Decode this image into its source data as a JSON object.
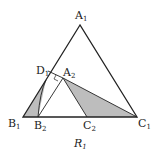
{
  "diagram": {
    "caption": "R",
    "caption_sub": "1",
    "colors": {
      "stroke": "#222222",
      "fill": "#bdbdbd",
      "background": "#ffffff"
    },
    "points": {
      "A1": {
        "label": "A",
        "sub": "1"
      },
      "B1": {
        "label": "B",
        "sub": "1"
      },
      "C1": {
        "label": "C",
        "sub": "1"
      },
      "A2": {
        "label": "A",
        "sub": "2"
      },
      "B2": {
        "label": "B",
        "sub": "2"
      },
      "C2": {
        "label": "C",
        "sub": "2"
      },
      "D1": {
        "label": "D",
        "sub": "1"
      }
    }
  }
}
